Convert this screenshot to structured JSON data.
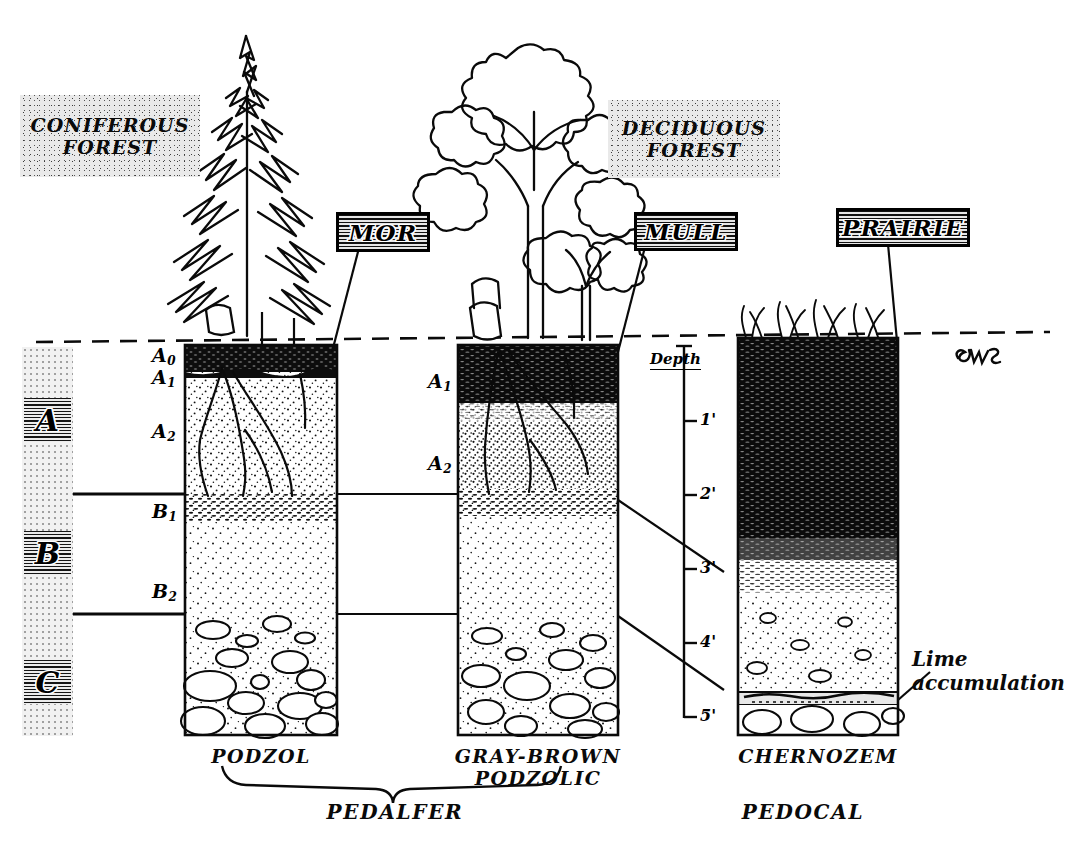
{
  "diagram": {
    "signature": "EWS"
  },
  "biomes": [
    {
      "name": "coniferous-forest",
      "line1": "CONIFEROUS",
      "line2": "FOREST"
    },
    {
      "name": "deciduous-forest",
      "line1": "DECIDUOUS",
      "line2": "FOREST"
    }
  ],
  "humus_plaques": [
    {
      "name": "mor",
      "label": "MOR"
    },
    {
      "name": "mull",
      "label": "MULL"
    },
    {
      "name": "prairie",
      "label": "PRAIRIE"
    }
  ],
  "master_horizons": [
    {
      "key": "A",
      "label": "A"
    },
    {
      "key": "B",
      "label": "B"
    },
    {
      "key": "C",
      "label": "C"
    }
  ],
  "sub_horizons": {
    "podzol": [
      "A",
      "A",
      "A"
    ],
    "podzol_sub": [
      "0",
      "1",
      "2"
    ],
    "podzol_b": [
      "B",
      "B"
    ],
    "podzol_b_sub": [
      "1",
      "2"
    ],
    "gray_brown": [
      "A",
      "A"
    ],
    "gray_brown_sub": [
      "1",
      "2"
    ]
  },
  "horizon_labels": [
    {
      "name": "A0",
      "base": "A",
      "sub": "0",
      "x": 152,
      "y": 349
    },
    {
      "name": "A1",
      "base": "A",
      "sub": "1",
      "x": 152,
      "y": 370
    },
    {
      "name": "A2",
      "base": "A",
      "sub": "2",
      "x": 152,
      "y": 424
    },
    {
      "name": "B1",
      "base": "B",
      "sub": "1",
      "x": 152,
      "y": 502
    },
    {
      "name": "B2",
      "base": "B",
      "sub": "2",
      "x": 152,
      "y": 583
    },
    {
      "name": "gb-A1",
      "base": "A",
      "sub": "1",
      "x": 430,
      "y": 372
    },
    {
      "name": "gb-A2",
      "base": "A",
      "sub": "2",
      "x": 430,
      "y": 455
    }
  ],
  "depth_scale": {
    "caption": "Depth",
    "ticks": [
      "1'",
      "2'",
      "3'",
      "4'",
      "5'"
    ],
    "unit": "feet",
    "surface_label": ""
  },
  "profiles": [
    {
      "name": "podzol",
      "label": "PODZOL"
    },
    {
      "name": "gray-brown-podzolic",
      "label": "GRAY-BROWN\nPODZOLIC"
    },
    {
      "name": "chernozem",
      "label": "CHERNOZEM"
    }
  ],
  "soil_orders": [
    {
      "name": "pedalfer",
      "label": "PEDALFER"
    },
    {
      "name": "pedocal",
      "label": "PEDOCAL"
    }
  ],
  "annotations": [
    {
      "name": "lime-accumulation",
      "label": "Lime\naccumulation"
    }
  ],
  "colors": {
    "ink": "#0a0a0a",
    "paper": "#ffffff",
    "stipple": "#e9e9e9",
    "plaque_fill": "#cfcfcf",
    "organic_dark": "#101010"
  }
}
